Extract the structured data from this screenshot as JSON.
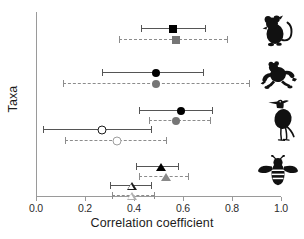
{
  "chart_data": {
    "type": "scatter",
    "title": "",
    "xlabel": "Correlation coefficient",
    "ylabel": "Taxa",
    "xlim": [
      0.0,
      1.0
    ],
    "xticks": [
      0.0,
      0.2,
      0.4,
      0.6,
      0.8,
      1.0
    ],
    "xtick_labels": [
      "0.0",
      "0.2",
      "0.4",
      "0.6",
      "0.8",
      "1.0"
    ],
    "grid": false,
    "legend": "none",
    "categories": [
      "Rodent",
      "Frog",
      "Heron",
      "Bee"
    ],
    "series": [
      {
        "name": "Rodent - solid",
        "taxon": "Rodent",
        "marker": "square",
        "style": "solid",
        "fill": "black",
        "estimate": 0.56,
        "ci_low": 0.43,
        "ci_high": 0.69
      },
      {
        "name": "Rodent - dashed",
        "taxon": "Rodent",
        "marker": "square",
        "style": "dashed",
        "fill": "gray",
        "estimate": 0.57,
        "ci_low": 0.34,
        "ci_high": 0.78
      },
      {
        "name": "Frog - solid",
        "taxon": "Frog",
        "marker": "circle",
        "style": "solid",
        "fill": "black",
        "estimate": 0.49,
        "ci_low": 0.27,
        "ci_high": 0.68
      },
      {
        "name": "Frog - dashed",
        "taxon": "Frog",
        "marker": "circle",
        "style": "dashed",
        "fill": "gray",
        "estimate": 0.49,
        "ci_low": 0.11,
        "ci_high": 0.87
      },
      {
        "name": "Heron - solid filled",
        "taxon": "Heron",
        "marker": "circle",
        "style": "solid",
        "fill": "black",
        "estimate": 0.59,
        "ci_low": 0.42,
        "ci_high": 0.72
      },
      {
        "name": "Heron - dashed filled",
        "taxon": "Heron",
        "marker": "circle",
        "style": "dashed",
        "fill": "gray",
        "estimate": 0.57,
        "ci_low": 0.46,
        "ci_high": 0.71
      },
      {
        "name": "Heron - solid open",
        "taxon": "Heron",
        "marker": "circle",
        "style": "solid",
        "fill": "open",
        "estimate": 0.27,
        "ci_low": 0.03,
        "ci_high": 0.47
      },
      {
        "name": "Heron - dashed open",
        "taxon": "Heron",
        "marker": "circle",
        "style": "dashed",
        "fill": "open-gray",
        "estimate": 0.33,
        "ci_low": 0.12,
        "ci_high": 0.53
      },
      {
        "name": "Bee - solid filled",
        "taxon": "Bee",
        "marker": "triangle",
        "style": "solid",
        "fill": "black",
        "estimate": 0.51,
        "ci_low": 0.41,
        "ci_high": 0.58
      },
      {
        "name": "Bee - dashed filled",
        "taxon": "Bee",
        "marker": "triangle",
        "style": "dashed",
        "fill": "gray",
        "estimate": 0.53,
        "ci_low": 0.42,
        "ci_high": 0.62
      },
      {
        "name": "Bee - solid open",
        "taxon": "Bee",
        "marker": "triangle",
        "style": "solid",
        "fill": "open",
        "estimate": 0.39,
        "ci_low": 0.3,
        "ci_high": 0.47
      },
      {
        "name": "Bee - dashed open",
        "taxon": "Bee",
        "marker": "triangle",
        "style": "dashed",
        "fill": "open-gray",
        "estimate": 0.39,
        "ci_low": 0.31,
        "ci_high": 0.48
      }
    ]
  },
  "axes": {
    "x_title": "Correlation coefficient",
    "y_title": "Taxa",
    "x_tick_labels": [
      "0.0",
      "0.2",
      "0.4",
      "0.6",
      "0.8",
      "1.0"
    ]
  },
  "taxa_icons": [
    {
      "name": "rodent-icon",
      "label": "Rodent"
    },
    {
      "name": "frog-icon",
      "label": "Frog"
    },
    {
      "name": "heron-icon",
      "label": "Heron"
    },
    {
      "name": "bee-icon",
      "label": "Bee"
    }
  ],
  "colors": {
    "marker_dark": "#000000",
    "marker_gray": "#767676",
    "line_solid": "#555555",
    "line_dashed": "#8c8c8c",
    "axis": "#9a9a9a",
    "text": "#1c1c1c",
    "background": "#ffffff"
  }
}
